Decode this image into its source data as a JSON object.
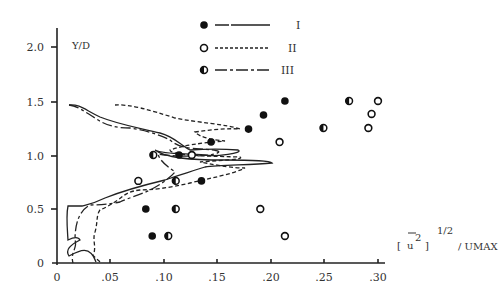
{
  "chart_data": {
    "type": "scatter",
    "title": "",
    "xlabel": "[u'^2]^1/2 / UMAX",
    "ylabel": "Y/D",
    "xlim": [
      0,
      0.31
    ],
    "ylim": [
      0,
      2.1
    ],
    "x_ticks": [
      "0",
      ".05",
      ".10",
      ".15",
      ".20",
      ".25",
      ".30"
    ],
    "y_ticks": [
      "0",
      "0.5",
      "1.0",
      "1.5",
      "2.0"
    ],
    "grid": false,
    "legend_position": "top-center",
    "series": [
      {
        "name": "I",
        "marker": "filled-circle",
        "line": "solid",
        "points": [
          [
            0.213,
            1.5
          ],
          [
            0.193,
            1.37
          ],
          [
            0.179,
            1.24
          ],
          [
            0.144,
            1.12
          ],
          [
            0.114,
            1.0
          ],
          [
            0.135,
            0.76
          ],
          [
            0.083,
            0.5
          ],
          [
            0.089,
            0.25
          ]
        ]
      },
      {
        "name": "II",
        "marker": "open-circle",
        "line": "dashed",
        "points": [
          [
            0.3,
            1.5
          ],
          [
            0.294,
            1.38
          ],
          [
            0.291,
            1.25
          ],
          [
            0.208,
            1.12
          ],
          [
            0.126,
            1.0
          ],
          [
            0.076,
            0.76
          ],
          [
            0.19,
            0.5
          ],
          [
            0.213,
            0.25
          ]
        ]
      },
      {
        "name": "III",
        "marker": "half-filled-circle",
        "line": "dash-dot",
        "points": [
          [
            0.273,
            1.5
          ],
          [
            0.249,
            1.25
          ],
          [
            0.09,
            1.0
          ],
          [
            0.111,
            0.76
          ],
          [
            0.111,
            0.5
          ],
          [
            0.104,
            0.25
          ]
        ]
      }
    ]
  },
  "labels": {
    "y_axis": "Y/D",
    "x_axis_bracket_open": "[",
    "x_axis_u": "u",
    "x_axis_sq": "2",
    "x_axis_bracket_close": "]",
    "x_axis_power": "1/2",
    "x_axis_div": "/ UMAX",
    "legend": [
      "I",
      "II",
      "III"
    ]
  }
}
